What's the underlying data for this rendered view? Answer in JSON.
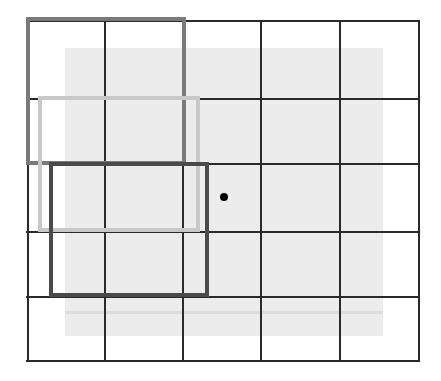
{
  "diagram": {
    "type": "grid-with-bounding-boxes",
    "background_region": {
      "x": 65,
      "y": 48,
      "w": 318,
      "h": 288,
      "color": "#ececec"
    },
    "background_stripe": {
      "x": 65,
      "y": 311,
      "w": 318,
      "color": "#dcdcdc"
    },
    "grid": {
      "line_color": "#2a2a2a",
      "columns_x": [
        27,
        104,
        182,
        260,
        339,
        418
      ],
      "rows_y": [
        20,
        98,
        163,
        231,
        296,
        360
      ],
      "top": 20,
      "bottom": 362,
      "left": 26,
      "right": 420
    },
    "boxes": [
      {
        "name": "box-1",
        "x": 26,
        "y": 17,
        "w": 160,
        "h": 148,
        "color": "#7a7a7a",
        "stroke": 4
      },
      {
        "name": "box-2",
        "x": 38,
        "y": 96,
        "w": 162,
        "h": 136,
        "color": "#c8c8c8",
        "stroke": 4
      },
      {
        "name": "box-3",
        "x": 49,
        "y": 162,
        "w": 160,
        "h": 135,
        "color": "#4a4a4a",
        "stroke": 4
      }
    ],
    "point": {
      "x": 224,
      "y": 197,
      "color": "#000000"
    }
  }
}
